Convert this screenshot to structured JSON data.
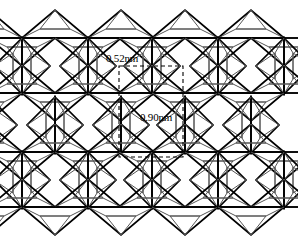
{
  "figure": {
    "background_color": "#ffffff",
    "line_color": "#000000",
    "thin_line_color": "#555555",
    "dashed_color": "#000000"
  },
  "labels": {
    "cell_width": "0.52nm",
    "cell_height": "0.90nm"
  },
  "unit_cell": {
    "x": 119,
    "y": 66,
    "width": 64,
    "height": 91,
    "stroke_dasharray": "4,3"
  },
  "chart_data": {
    "type": "diagram",
    "annotations": [
      "0.52nm",
      "0.90nm"
    ],
    "lattice": {
      "description": "Hexagonal rings of corner-sharing tetrahedra drawn as triangles with internal apex lines",
      "hex_center_x": [
        22,
        88,
        152,
        218,
        284
      ],
      "hex_center_y": [
        66,
        125,
        180
      ],
      "row_line_y": [
        38,
        93,
        152,
        207
      ],
      "column_spacing_px": 66,
      "row_spacing_px": 59,
      "triangle_half_width_px": 33,
      "triangle_height_px": 28
    }
  },
  "geometry": {
    "rows": [
      38,
      93,
      152,
      207
    ],
    "cols": [
      -11,
      22,
      55,
      88,
      121,
      152,
      185,
      218,
      251,
      284
    ],
    "up_triangles_row_offsets": [
      0
    ],
    "comment": "Coordinates in source-image pixel space, 298x247"
  }
}
